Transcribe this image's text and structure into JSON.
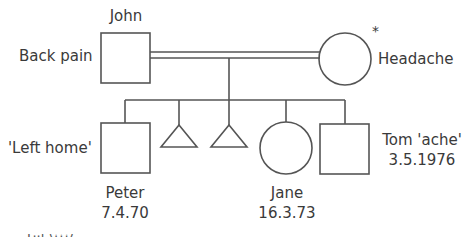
{
  "diagram": {
    "type": "genogram",
    "stroke_color": "#555555",
    "parents": {
      "father": {
        "name": "John",
        "note": "Back pain",
        "shape": "square"
      },
      "mother": {
        "name": "",
        "note": "Headache",
        "marker": "*",
        "shape": "circle"
      },
      "relationship": "married (double line)"
    },
    "children": [
      {
        "name": "Peter",
        "date": "7.4.70",
        "note": "'Left home'",
        "shape": "square"
      },
      {
        "name": "",
        "note": "",
        "shape": "triangle",
        "meaning": "miscarriage/pregnancy"
      },
      {
        "name": "",
        "note": "",
        "shape": "triangle",
        "meaning": "miscarriage/pregnancy"
      },
      {
        "name": "Jane",
        "date": "16.3.73",
        "shape": "circle"
      },
      {
        "name": "Tom 'ache'",
        "date": "3.5.1976",
        "shape": "square"
      }
    ],
    "caption_fragment": "F..l (!!!)"
  }
}
